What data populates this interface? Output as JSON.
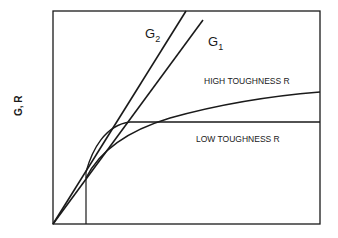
{
  "diagram": {
    "type": "R-curve fracture diagram",
    "y_axis_label": "G, R",
    "x_axis_label": "",
    "lines": [
      {
        "name": "G2",
        "label_main": "G",
        "label_sub": "2"
      },
      {
        "name": "G1",
        "label_main": "G",
        "label_sub": "1"
      }
    ],
    "curves": [
      {
        "name": "high-toughness",
        "label": "HIGH TOUGHNESS R"
      },
      {
        "name": "low-toughness",
        "label": "LOW TOUGHNESS R"
      }
    ],
    "colors": {
      "line": "#1a1a1a",
      "background": "#ffffff"
    }
  }
}
